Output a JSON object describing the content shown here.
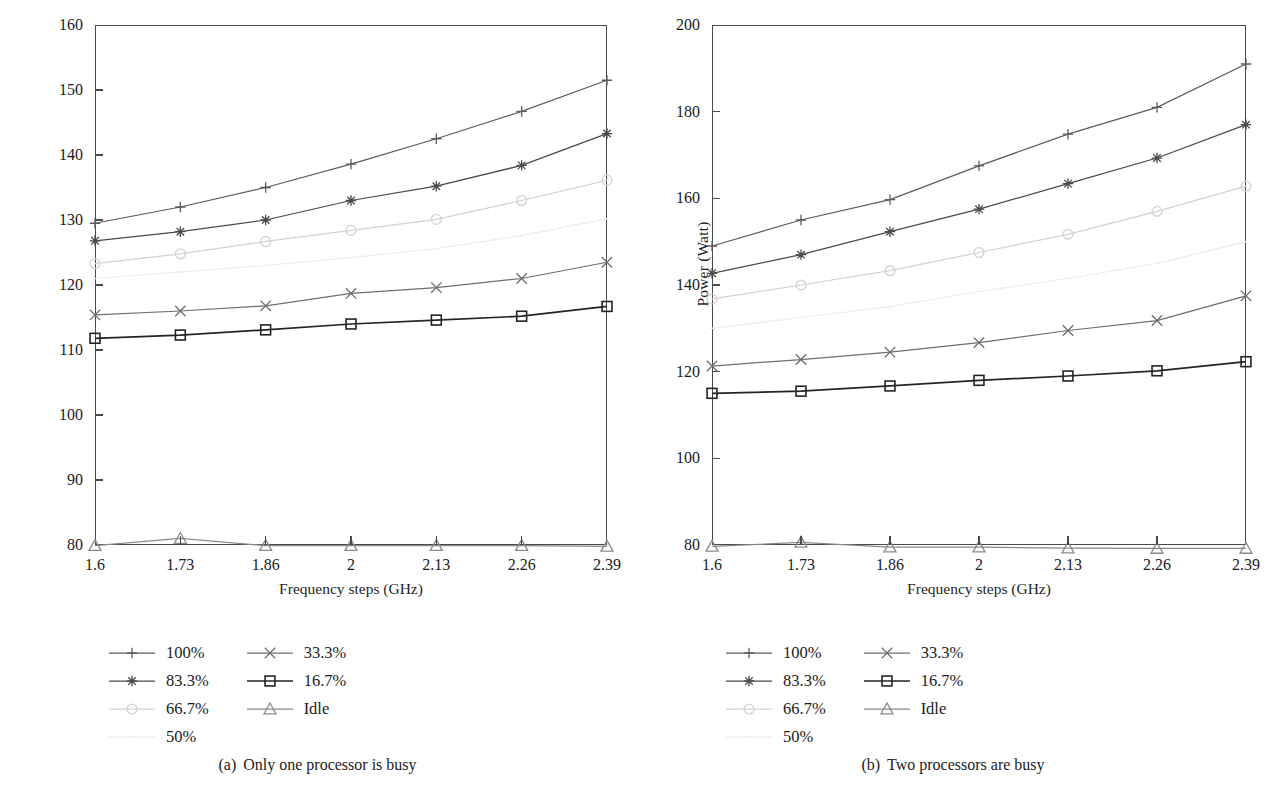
{
  "figure": {
    "axis_title_y": "Power (Watt)",
    "axis_title_x": "Frequency steps (GHz)"
  },
  "legend": {
    "entries": [
      {
        "label": "100%",
        "marker": "plus-marker",
        "color": "#5c5c5c",
        "column": 0
      },
      {
        "label": "83.3%",
        "marker": "asterisk-marker",
        "color": "#4a4a4a",
        "column": 0
      },
      {
        "label": "66.7%",
        "marker": "circle-marker",
        "color": "#d2d2d2",
        "column": 0
      },
      {
        "label": "50%",
        "marker": "dot-marker",
        "color": "#ececec",
        "column": 0
      },
      {
        "label": "33.3%",
        "marker": "cross-marker",
        "color": "#6e6e6e",
        "column": 1
      },
      {
        "label": "16.7%",
        "marker": "square-marker",
        "color": "#242424",
        "column": 1
      },
      {
        "label": "Idle",
        "marker": "triangle-marker",
        "color": "#8a8a8a",
        "column": 1
      }
    ]
  },
  "panels": [
    {
      "id": "panel-a",
      "caption_tag": "(a)",
      "caption_text": "Only one processor is busy",
      "chart_data": {
        "type": "line",
        "title": "",
        "xlabel": "Frequency steps (GHz)",
        "ylabel": "Power (Watt)",
        "categories": [
          "1.6",
          "1.73",
          "1.86",
          "2",
          "2.13",
          "2.26",
          "2.39"
        ],
        "x": [
          1.6,
          1.73,
          1.86,
          2,
          2.13,
          2.26,
          2.39
        ],
        "ylim": [
          80,
          160
        ],
        "yticks": [
          80,
          90,
          100,
          110,
          120,
          130,
          140,
          150,
          160
        ],
        "grid": false,
        "legend_position": "below-left",
        "series": [
          {
            "name": "100%",
            "marker": "plus-marker",
            "color": "#5c5c5c",
            "values": [
              129.5,
              132.0,
              135.0,
              138.6,
              142.5,
              146.7,
              151.5
            ]
          },
          {
            "name": "83.3%",
            "marker": "asterisk-marker",
            "color": "#4a4a4a",
            "values": [
              126.8,
              128.2,
              130.0,
              133.0,
              135.2,
              138.4,
              143.3
            ]
          },
          {
            "name": "66.7%",
            "marker": "circle-marker",
            "color": "#d2d2d2",
            "values": [
              123.3,
              124.8,
              126.7,
              128.4,
              130.1,
              133.0,
              136.1
            ]
          },
          {
            "name": "50%",
            "marker": "dot-marker",
            "color": "#ececec",
            "values": [
              121.0,
              122.0,
              123.0,
              124.2,
              125.6,
              127.6,
              130.2
            ]
          },
          {
            "name": "33.3%",
            "marker": "cross-marker",
            "color": "#6e6e6e",
            "values": [
              115.4,
              116.0,
              116.8,
              118.7,
              119.6,
              121.0,
              123.5
            ]
          },
          {
            "name": "16.7%",
            "marker": "square-marker",
            "color": "#242424",
            "values": [
              111.8,
              112.3,
              113.1,
              114.0,
              114.6,
              115.2,
              116.7
            ]
          },
          {
            "name": "Idle",
            "marker": "triangle-marker",
            "color": "#8a8a8a",
            "values": [
              79.9,
              81.0,
              79.9,
              79.9,
              79.9,
              79.9,
              79.8
            ]
          }
        ]
      }
    },
    {
      "id": "panel-b",
      "caption_tag": "(b)",
      "caption_text": "Two processors are busy",
      "chart_data": {
        "type": "line",
        "title": "",
        "xlabel": "Frequency steps (GHz)",
        "ylabel": "Power (Watt)",
        "categories": [
          "1.6",
          "1.73",
          "1.86",
          "2",
          "2.13",
          "2.26",
          "2.39"
        ],
        "x": [
          1.6,
          1.73,
          1.86,
          2,
          2.13,
          2.26,
          2.39
        ],
        "ylim": [
          80,
          200
        ],
        "yticks": [
          80,
          100,
          120,
          140,
          160,
          180,
          200
        ],
        "grid": false,
        "legend_position": "below-left",
        "series": [
          {
            "name": "100%",
            "marker": "plus-marker",
            "color": "#5c5c5c",
            "values": [
              149.0,
              155.0,
              159.7,
              167.5,
              174.8,
              181.0,
              191.0
            ]
          },
          {
            "name": "83.3%",
            "marker": "asterisk-marker",
            "color": "#4a4a4a",
            "values": [
              142.7,
              147.0,
              152.3,
              157.5,
              163.4,
              169.3,
              177.0
            ]
          },
          {
            "name": "66.7%",
            "marker": "circle-marker",
            "color": "#d2d2d2",
            "values": [
              136.8,
              140.0,
              143.3,
              147.5,
              151.7,
              157.0,
              162.8
            ]
          },
          {
            "name": "50%",
            "marker": "dot-marker",
            "color": "#ececec",
            "values": [
              130.0,
              132.5,
              135.0,
              138.5,
              141.5,
              145.0,
              150.0
            ]
          },
          {
            "name": "33.3%",
            "marker": "cross-marker",
            "color": "#6e6e6e",
            "values": [
              121.3,
              122.8,
              124.5,
              126.7,
              129.5,
              131.8,
              137.5
            ]
          },
          {
            "name": "16.7%",
            "marker": "square-marker",
            "color": "#242424",
            "values": [
              115.0,
              115.5,
              116.7,
              118.0,
              119.0,
              120.2,
              122.3
            ]
          },
          {
            "name": "Idle",
            "marker": "triangle-marker",
            "color": "#8a8a8a",
            "values": [
              79.7,
              80.6,
              79.5,
              79.5,
              79.3,
              79.2,
              79.2
            ]
          }
        ]
      }
    }
  ]
}
